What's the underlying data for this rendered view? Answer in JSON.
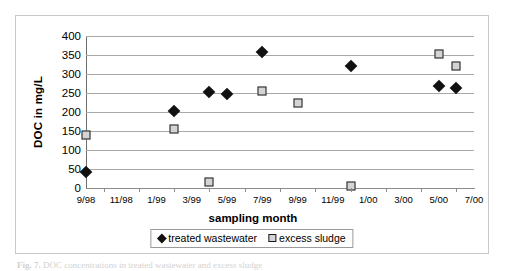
{
  "figure": {
    "caption_label": "Fig. 7.",
    "caption_text": "DOC concentrations in treated wastewater and excess sludge"
  },
  "chart_data": {
    "type": "scatter",
    "title": "",
    "xlabel": "sampling month",
    "ylabel": "DOC in mg/L",
    "ylim": [
      0,
      400
    ],
    "ytick_step": 50,
    "yticks": [
      "400",
      "350",
      "300",
      "250",
      "200",
      "150",
      "100",
      "50",
      "0"
    ],
    "ytick_values": [
      400,
      350,
      300,
      250,
      200,
      150,
      100,
      50,
      0
    ],
    "xticks": [
      "9/98",
      "11/98",
      "1/99",
      "3/99",
      "5/99",
      "7/99",
      "9/99",
      "11/99",
      "1/00",
      "3/00",
      "5/00",
      "7/00"
    ],
    "xlim": [
      "9/98",
      "7/00"
    ],
    "grid": "horizontal",
    "legend_position": "bottom",
    "series": [
      {
        "name": "treated wastewater",
        "marker": "filled-diamond",
        "color": "#111111",
        "points": [
          {
            "x": "9/98",
            "y": 42
          },
          {
            "x": "2/99",
            "y": 203
          },
          {
            "x": "4/99",
            "y": 252
          },
          {
            "x": "5/99",
            "y": 248
          },
          {
            "x": "7/99",
            "y": 357
          },
          {
            "x": "12/99",
            "y": 322
          },
          {
            "x": "5/00",
            "y": 268
          },
          {
            "x": "6/00",
            "y": 263
          }
        ]
      },
      {
        "name": "excess sludge",
        "marker": "open-square",
        "color": "#d4d4d4",
        "points": [
          {
            "x": "9/98",
            "y": 140
          },
          {
            "x": "2/99",
            "y": 155
          },
          {
            "x": "4/99",
            "y": 15
          },
          {
            "x": "7/99",
            "y": 256
          },
          {
            "x": "9/99",
            "y": 224
          },
          {
            "x": "12/99",
            "y": 5
          },
          {
            "x": "5/00",
            "y": 352
          },
          {
            "x": "6/00",
            "y": 320
          }
        ]
      }
    ]
  },
  "legend": {
    "entries": [
      {
        "label": "treated wastewater",
        "marker": "filled-diamond"
      },
      {
        "label": "excess sludge",
        "marker": "open-square"
      }
    ]
  }
}
